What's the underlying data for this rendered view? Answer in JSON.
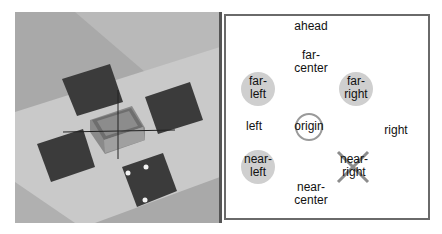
{
  "scene": {
    "description": "3D rendered tabletop with central box and four dark square pads",
    "colors": {
      "floor": "#b4b4b4",
      "mat": "#c8c8c8",
      "pad": "#3a3a3a",
      "box": "#7a7a7a"
    }
  },
  "map": {
    "labels": {
      "ahead": "ahead",
      "far_center": "far-\ncenter",
      "far_left": "far-\nleft",
      "far_right": "far-\nright",
      "left": "left",
      "origin": "origin",
      "right": "right",
      "near_left": "near-\nleft",
      "near_right": "near-\nright",
      "near_center": "near-\ncenter"
    },
    "markers": {
      "filled_color": "#cfcfcf",
      "ring_color": "#9a9a9a",
      "cross_color": "#8c8c8c"
    }
  }
}
